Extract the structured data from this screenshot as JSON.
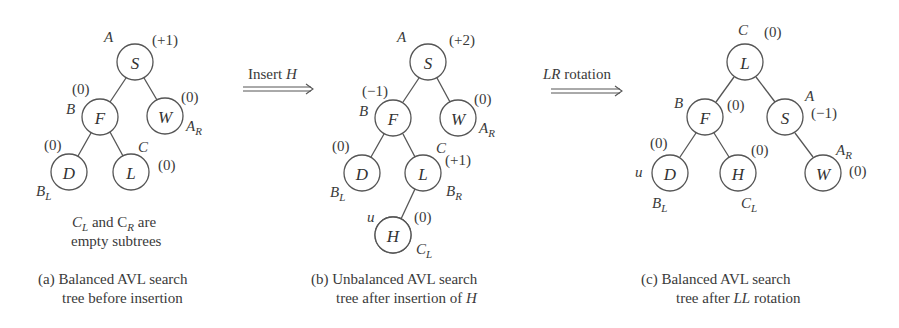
{
  "arrows": [
    {
      "label_plain": "Insert ",
      "label_italic": "H"
    },
    {
      "label_italic": "LR",
      "label_plain": " rotation"
    }
  ],
  "panels": [
    {
      "id": "a",
      "note_line1_pre": "C",
      "note_line1_sub1": "L",
      "note_line1_mid": " and C",
      "note_line1_sub2": "R",
      "note_line1_post": " are",
      "note_line2": "empty subtrees",
      "caption_line1": "(a) Balanced AVL search",
      "caption_line2": "tree before insertion",
      "nodes": {
        "S": {
          "key": "S",
          "tag": "A",
          "bf": "(+1)"
        },
        "F": {
          "key": "F",
          "tag": "B",
          "bf": "(0)"
        },
        "W": {
          "key": "W",
          "tag": "A",
          "tag_sub": "R",
          "bf": "(0)"
        },
        "D": {
          "key": "D",
          "tag": "B",
          "tag_sub": "L",
          "bf": "(0)"
        },
        "L": {
          "key": "L",
          "tag": "C",
          "bf": "(0)"
        }
      }
    },
    {
      "id": "b",
      "caption_line1": "(b) Unbalanced AVL search",
      "caption_line2_plain": "tree after insertion of ",
      "caption_line2_italic": "H",
      "nodes": {
        "S": {
          "key": "S",
          "tag": "A",
          "bf": "(+2)"
        },
        "F": {
          "key": "F",
          "tag": "B",
          "bf": "(−1)"
        },
        "W": {
          "key": "W",
          "tag": "A",
          "tag_sub": "R",
          "bf": "(0)"
        },
        "D": {
          "key": "D",
          "tag": "B",
          "tag_sub": "L",
          "bf": "(0)"
        },
        "L": {
          "key": "L",
          "tag": "C",
          "tag2": "B",
          "tag2_sub": "R",
          "bf": "(+1)"
        },
        "H": {
          "key": "H",
          "tag": "u",
          "tag2": "C",
          "tag2_sub": "L",
          "bf": "(0)",
          "highlighted": true
        }
      }
    },
    {
      "id": "c",
      "caption_line1": "(c) Balanced AVL search",
      "caption_line2_plain1": "tree after ",
      "caption_line2_italic": "LL",
      "caption_line2_plain2": " rotation",
      "nodes": {
        "L": {
          "key": "L",
          "tag": "C",
          "bf": "(0)"
        },
        "F": {
          "key": "F",
          "tag": "B",
          "bf": "(0)"
        },
        "S": {
          "key": "S",
          "tag": "A",
          "bf": "(−1)"
        },
        "D": {
          "key": "D",
          "tag": "u",
          "tag2": "B",
          "tag2_sub": "L",
          "bf": "(0)"
        },
        "H": {
          "key": "H",
          "tag": "C",
          "tag_sub": "L",
          "bf": "(0)"
        },
        "W": {
          "key": "W",
          "tag": "A",
          "tag_sub": "R",
          "bf": "(0)"
        }
      }
    }
  ]
}
